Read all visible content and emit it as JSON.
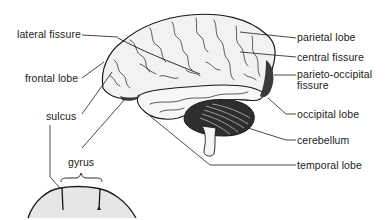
{
  "diagram": {
    "type": "labeled-anatomy",
    "labels_left": {
      "lateral_fissure": "lateral fissure",
      "frontal_lobe": "frontal lobe",
      "sulcus": "sulcus",
      "gyrus": "gyrus"
    },
    "labels_right": {
      "parietal_lobe": "parietal  lobe",
      "central_fissure": "central fissure",
      "parieto_occipital_line1": "parieto-occipital",
      "parieto_occipital_line2": "fissure",
      "occipital_lobe": "occipital  lobe",
      "cerebellum": "cerebellum",
      "temporal_lobe": "temporal  lobe"
    },
    "colors": {
      "line": "#1a1a1a",
      "brain_fill": "#f2f2f2",
      "shade": "#3a3a3a",
      "stipple": "#d9d9d9"
    }
  }
}
